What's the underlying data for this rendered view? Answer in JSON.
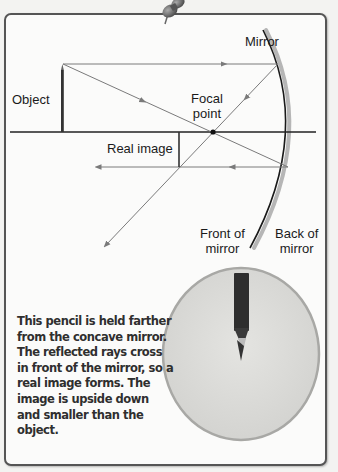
{
  "diagram": {
    "labels": {
      "mirror": "Mirror",
      "object": "Object",
      "focal_point_line1": "Focal",
      "focal_point_line2": "point",
      "real_image": "Real image",
      "front_line1": "Front of",
      "front_line2": "mirror",
      "back_line1": "Back of",
      "back_line2": "mirror"
    },
    "caption_lines": [
      "This pencil is held farther",
      "from the concave mirror.",
      "The reflected rays cross",
      "in front of the mirror, so a",
      "real image forms. The",
      "image is upside down",
      "and smaller than the",
      "object."
    ],
    "colors": {
      "ray": "#7a7a7a",
      "axis": "#222222",
      "mirror": "#1a1a1a",
      "mirror_shade": "#9a9a9a",
      "lens_fill": "#d9d9d6",
      "lens_rim": "#a8a8a5",
      "pencil": "#2e2e2e",
      "card_border": "#555555"
    },
    "icons": [
      "pushpin-icon",
      "pencil-object-icon",
      "pencil-reflection-icon"
    ]
  }
}
